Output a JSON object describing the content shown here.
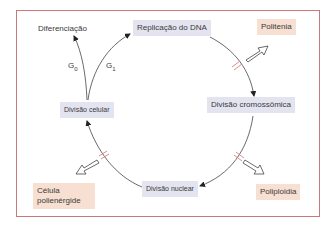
{
  "diagram": {
    "frame_color": "#c9797a",
    "box_colors": {
      "state": "#e4e4f1",
      "outcome": "#f7e0d2"
    },
    "nodes": {
      "diferenciacao": "Diferenciação",
      "replicacao": "Replicação do DNA",
      "politenia": "Politenia",
      "divisao_celular": "Divisão celular",
      "divisao_cromossomica": "Divisão cromossômica",
      "divisao_nuclear": "Divisão nuclear",
      "celula_polienergide_line1": "Célula",
      "celula_polienergide_line2": "polienérgide",
      "poliploidia": "Poliploidia"
    },
    "phases": {
      "g0_letter": "G",
      "g0_sub": "0",
      "g1_letter": "G",
      "g1_sub": "1"
    },
    "edges": [
      {
        "from": "Divisão celular",
        "to": "Diferenciação",
        "label": "G0"
      },
      {
        "from": "Divisão celular",
        "to": "Replicação do DNA",
        "label": "G1"
      },
      {
        "from": "Replicação do DNA",
        "to": "Divisão cromossômica",
        "blocked_to": "Politenia"
      },
      {
        "from": "Divisão cromossômica",
        "to": "Divisão nuclear",
        "blocked_to": "Poliploidia"
      },
      {
        "from": "Divisão nuclear",
        "to": "Divisão celular",
        "blocked_to": "Célula polienérgide"
      }
    ]
  }
}
